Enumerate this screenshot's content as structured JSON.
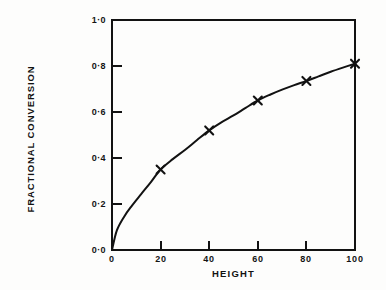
{
  "figure": {
    "background_color": "#fdfdfc",
    "ink_color": "#121212"
  },
  "chart_data": {
    "type": "line",
    "title": "",
    "subtitle": "",
    "xlabel": "HEIGHT",
    "ylabel": "FRACTIONAL CONVERSION",
    "xlim": [
      0,
      100
    ],
    "ylim": [
      0.0,
      1.0
    ],
    "grid": false,
    "legend": null,
    "legend_position": "none",
    "xticks": [
      0,
      20,
      40,
      60,
      80,
      100
    ],
    "xtick_labels": [
      "0",
      "20",
      "40",
      "60",
      "80",
      "100"
    ],
    "yticks": [
      0.0,
      0.2,
      0.4,
      0.6,
      0.8,
      1.0
    ],
    "ytick_labels": [
      "0·0",
      "0·2",
      "0·4",
      "0·6",
      "0·8",
      "1·0"
    ],
    "series": [
      {
        "name": "fractional conversion",
        "marker": "x",
        "line_style": "solid",
        "color": "#121212",
        "x": [
          20,
          40,
          60,
          80,
          100
        ],
        "values": [
          0.35,
          0.52,
          0.65,
          0.735,
          0.81
        ]
      }
    ],
    "curve": {
      "name": "fitted curve",
      "x": [
        0,
        2,
        5,
        8,
        12,
        16,
        20,
        25,
        30,
        35,
        40,
        45,
        50,
        55,
        60,
        65,
        70,
        75,
        80,
        85,
        90,
        95,
        100
      ],
      "y": [
        0.0,
        0.085,
        0.145,
        0.19,
        0.243,
        0.295,
        0.35,
        0.395,
        0.435,
        0.478,
        0.52,
        0.555,
        0.585,
        0.618,
        0.65,
        0.675,
        0.697,
        0.717,
        0.735,
        0.755,
        0.775,
        0.793,
        0.81
      ]
    },
    "annotations": []
  },
  "axes": {
    "frame": {
      "left_px": 112,
      "right_px": 355,
      "top_px": 20,
      "bottom_px": 250
    },
    "tick_direction": "in",
    "spines": [
      "left",
      "right",
      "top",
      "bottom"
    ]
  }
}
